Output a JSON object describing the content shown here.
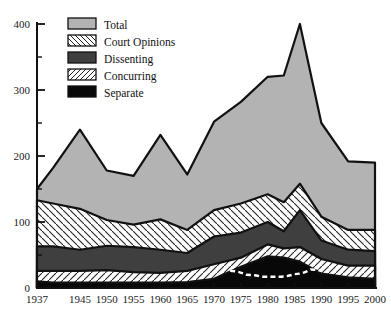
{
  "chart_data": {
    "type": "area",
    "title": "",
    "subtitle": "",
    "xlabel": "",
    "ylabel": "",
    "stacked": true,
    "grid": false,
    "legend_position": "top-left",
    "xlim": [
      1937,
      2000
    ],
    "ylim": [
      0,
      400
    ],
    "yticks": [
      0,
      100,
      200,
      300,
      400
    ],
    "yticklabels": [
      "0",
      "100",
      "200",
      "300",
      "400"
    ],
    "yminor_step": 50,
    "xticks": [
      1937,
      1945,
      1950,
      1955,
      1960,
      1965,
      1970,
      1975,
      1980,
      1985,
      1990,
      1995,
      2000
    ],
    "xticklabels": [
      "1937",
      "1945",
      "1950",
      "1955",
      "1960",
      "1965",
      "1970",
      "1975",
      "1980",
      "1985",
      "1990",
      "1995",
      "2000"
    ],
    "x": [
      1937,
      1940,
      1945,
      1950,
      1955,
      1960,
      1965,
      1970,
      1975,
      1980,
      1983,
      1986,
      1990,
      1995,
      2000
    ],
    "series": [
      {
        "name": "Total",
        "fill": "#b3b3b3",
        "pattern": "solid",
        "values": [
          150,
          182,
          240,
          178,
          170,
          232,
          172,
          252,
          282,
          320,
          322,
          400,
          250,
          192,
          190
        ]
      },
      {
        "name": "Court Opinions",
        "fill": "#ffffff",
        "pattern": "diagonal-hatch-back",
        "values": [
          133,
          128,
          120,
          103,
          96,
          104,
          88,
          118,
          128,
          142,
          130,
          158,
          108,
          88,
          88
        ]
      },
      {
        "name": "Dissenting",
        "fill": "#3f3f3f",
        "pattern": "solid",
        "values": [
          63,
          63,
          58,
          64,
          62,
          58,
          53,
          78,
          84,
          100,
          86,
          118,
          72,
          58,
          56
        ]
      },
      {
        "name": "Concurring",
        "fill": "#ffffff",
        "pattern": "diagonal-hatch-fwd",
        "values": [
          26,
          26,
          26,
          27,
          24,
          23,
          26,
          36,
          46,
          66,
          60,
          62,
          44,
          34,
          34
        ]
      },
      {
        "name": "Separate",
        "fill": "#080808",
        "pattern": "solid",
        "values": [
          10,
          8,
          8,
          8,
          8,
          8,
          9,
          14,
          32,
          48,
          46,
          40,
          22,
          16,
          14
        ]
      }
    ],
    "annotation_line": {
      "name": "dashed-overlay",
      "style": "dashed",
      "color": "#ffffff",
      "x": [
        1973,
        1976,
        1979,
        1982,
        1985,
        1988,
        1990
      ],
      "y": [
        26,
        20,
        17,
        17,
        21,
        28,
        26
      ]
    }
  },
  "legend": {
    "items": [
      {
        "label": "Total",
        "swatch": "solid-gray"
      },
      {
        "label": "Court Opinions",
        "swatch": "hatch-back"
      },
      {
        "label": "Dissenting",
        "swatch": "solid-darkgray"
      },
      {
        "label": "Concurring",
        "swatch": "hatch-fwd"
      },
      {
        "label": "Separate",
        "swatch": "solid-black"
      }
    ]
  },
  "colors": {
    "total": "#b3b3b3",
    "dissenting": "#3f3f3f",
    "separate": "#080808",
    "outline": "#111111",
    "background": "#ffffff"
  }
}
